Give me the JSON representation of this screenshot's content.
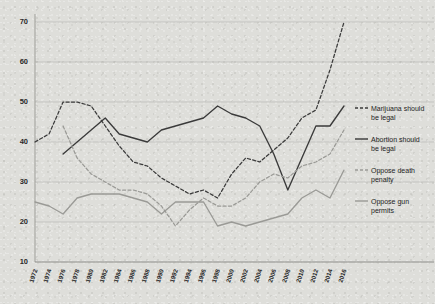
{
  "chart_data": {
    "type": "line",
    "title": "",
    "subtitle": "",
    "xlabel": "",
    "ylabel": "",
    "xlim": [
      1972,
      2016
    ],
    "ylim": [
      10,
      70
    ],
    "yticks": [
      10,
      20,
      30,
      40,
      50,
      60,
      70
    ],
    "grid": true,
    "legend_position": "right",
    "x": [
      1972,
      1974,
      1976,
      1978,
      1980,
      1982,
      1984,
      1986,
      1988,
      1990,
      1992,
      1994,
      1996,
      1998,
      2000,
      2002,
      2004,
      2006,
      2008,
      2010,
      2012,
      2014,
      2016
    ],
    "xticks": [
      "1972",
      "1974",
      "1976",
      "1978",
      "1980",
      "1982",
      "1984",
      "1986",
      "1988",
      "1990",
      "1992",
      "1994",
      "1996",
      "1998",
      "2000",
      "2002",
      "2004",
      "2006",
      "2008",
      "2010",
      "2012",
      "2014",
      "2016"
    ],
    "series": [
      {
        "name": "Marijuana should be legal",
        "key": "marijuana",
        "color": "#3a3a3a",
        "style": "dashed",
        "values": [
          40,
          42,
          50,
          50,
          49,
          44,
          39,
          35,
          34,
          31,
          29,
          27,
          28,
          26,
          32,
          36,
          35,
          38,
          41,
          46,
          48,
          58,
          70
        ]
      },
      {
        "name": "Abortion should be legal",
        "key": "abortion",
        "color": "#3a3a3a",
        "style": "solid",
        "values": [
          null,
          null,
          37,
          40,
          43,
          46,
          42,
          41,
          40,
          43,
          44,
          45,
          46,
          49,
          47,
          46,
          44,
          37,
          28,
          36,
          44,
          44,
          49
        ]
      },
      {
        "name": "Oppose death penalty",
        "key": "death_penalty",
        "color": "#9a9a96",
        "style": "dashed",
        "values": [
          null,
          null,
          44,
          36,
          32,
          30,
          28,
          28,
          27,
          24,
          19,
          23,
          26,
          24,
          24,
          26,
          30,
          32,
          31,
          34,
          35,
          37,
          43
        ]
      },
      {
        "name": "Oppose gun permits",
        "key": "gun_permits",
        "color": "#9a9a96",
        "style": "solid",
        "values": [
          25,
          24,
          22,
          26,
          27,
          27,
          27,
          26,
          25,
          22,
          25,
          25,
          25,
          19,
          20,
          19,
          20,
          21,
          22,
          26,
          28,
          26,
          33
        ]
      }
    ]
  },
  "legend": {
    "items": [
      {
        "label_line1": "Marijuana should",
        "label_line2": "be legal"
      },
      {
        "label_line1": "Abortion should",
        "label_line2": "be legal"
      },
      {
        "label_line1": "Oppose death",
        "label_line2": "penalty"
      },
      {
        "label_line1": "Oppose gun",
        "label_line2": "permits"
      }
    ]
  }
}
